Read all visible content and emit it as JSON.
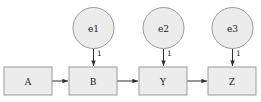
{
  "diagram": {
    "type": "path-diagram",
    "background_color": "#ffffff",
    "node_fill_color": "#ececec",
    "node_stroke_color": "#9a9a9a",
    "edge_color": "#303030",
    "observed_nodes": [
      {
        "id": "A",
        "label": "A",
        "shape": "rectangle",
        "x": 4,
        "y": 67,
        "w": 48,
        "h": 28
      },
      {
        "id": "B",
        "label": "B",
        "shape": "rectangle",
        "x": 69,
        "y": 67,
        "w": 48,
        "h": 28
      },
      {
        "id": "Y",
        "label": "Y",
        "shape": "rectangle",
        "x": 139,
        "y": 67,
        "w": 48,
        "h": 28
      },
      {
        "id": "Z",
        "label": "Z",
        "shape": "rectangle",
        "x": 208,
        "y": 67,
        "w": 48,
        "h": 28
      }
    ],
    "latent_nodes": [
      {
        "id": "e1",
        "label": "e1",
        "shape": "ellipse",
        "cx": 93.5,
        "cy": 28,
        "rx": 20.5,
        "ry": 20.5
      },
      {
        "id": "e2",
        "label": "e2",
        "shape": "ellipse",
        "cx": 163.5,
        "cy": 28,
        "rx": 20.5,
        "ry": 20.5
      },
      {
        "id": "e3",
        "label": "e3",
        "shape": "ellipse",
        "cx": 232.5,
        "cy": 28,
        "rx": 20.5,
        "ry": 20.5
      }
    ],
    "edges": [
      {
        "id": "a-to-b",
        "from": "A",
        "to": "B",
        "label": "",
        "orientation": "horizontal"
      },
      {
        "id": "b-to-y",
        "from": "B",
        "to": "Y",
        "label": "",
        "orientation": "horizontal"
      },
      {
        "id": "y-to-z",
        "from": "Y",
        "to": "Z",
        "label": "",
        "orientation": "horizontal"
      },
      {
        "id": "e1-to-b",
        "from": "e1",
        "to": "B",
        "label": "1",
        "orientation": "vertical"
      },
      {
        "id": "e2-to-y",
        "from": "e2",
        "to": "Y",
        "label": "1",
        "orientation": "vertical"
      },
      {
        "id": "e3-to-z",
        "from": "e3",
        "to": "Z",
        "label": "1",
        "orientation": "vertical"
      }
    ]
  }
}
